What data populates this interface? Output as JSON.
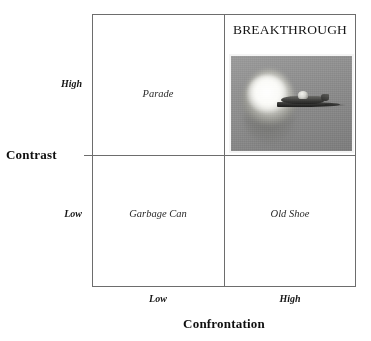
{
  "figure": {
    "type": "2x2-matrix",
    "name": "contrast-confrontation-matrix"
  },
  "axes": {
    "y": {
      "title": "Contrast",
      "high_label": "High",
      "low_label": "Low"
    },
    "x": {
      "title": "Confrontation",
      "low_label": "Low",
      "high_label": "High"
    }
  },
  "quadrants": {
    "top_left": {
      "label": "Parade"
    },
    "top_right": {
      "label": "BREAKTHROUGH",
      "image_caption": "jet-breaking-sound-barrier-photo"
    },
    "bottom_left": {
      "label": "Garbage Can"
    },
    "bottom_right": {
      "label": "Old Shoe"
    }
  },
  "chart_data": {
    "type": "table",
    "title": "",
    "xlabel": "Confrontation",
    "ylabel": "Contrast",
    "x_categories": [
      "Low",
      "High"
    ],
    "y_categories": [
      "High",
      "Low"
    ],
    "cells": [
      {
        "x": "Low",
        "y": "High",
        "label": "Parade"
      },
      {
        "x": "High",
        "y": "High",
        "label": "BREAKTHROUGH"
      },
      {
        "x": "Low",
        "y": "Low",
        "label": "Garbage Can"
      },
      {
        "x": "High",
        "y": "Low",
        "label": "Old Shoe"
      }
    ],
    "grid": true,
    "legend": "none"
  },
  "colors": {
    "line": "#6d6d6d",
    "text": "#1a1a1a",
    "photo_background": "#8e8e8e",
    "photo_border": "#f4f4f4"
  }
}
